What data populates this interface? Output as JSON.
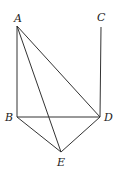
{
  "diagram": {
    "type": "geometry",
    "points": [
      {
        "id": "A",
        "label": "A",
        "x": 17,
        "y": 26,
        "lx": 14,
        "ly": 22
      },
      {
        "id": "B",
        "label": "B",
        "x": 17,
        "y": 117,
        "lx": 5,
        "ly": 121
      },
      {
        "id": "C",
        "label": "C",
        "x": 101,
        "y": 27,
        "lx": 97,
        "ly": 21
      },
      {
        "id": "D",
        "label": "D",
        "x": 100,
        "y": 117,
        "lx": 104,
        "ly": 121
      },
      {
        "id": "E",
        "label": "E",
        "x": 61,
        "y": 152,
        "lx": 57,
        "ly": 166
      }
    ],
    "segments": [
      [
        "A",
        "B"
      ],
      [
        "A",
        "D"
      ],
      [
        "A",
        "E"
      ],
      [
        "C",
        "D"
      ],
      [
        "B",
        "D"
      ],
      [
        "B",
        "E"
      ],
      [
        "D",
        "E"
      ]
    ]
  }
}
